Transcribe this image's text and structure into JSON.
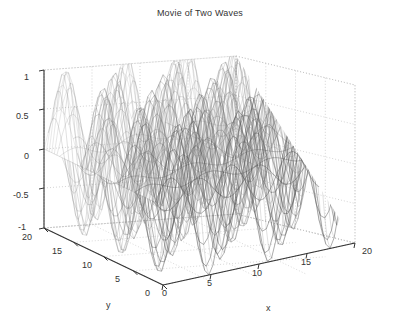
{
  "figure": {
    "title": "Movie of Two Waves",
    "background": "#ffffff",
    "axis_color": "#333333",
    "grid_style": "dotted",
    "surface_style": "mesh",
    "surface_colormap": "gray"
  },
  "axes": {
    "x": {
      "label": "x",
      "ticks": [
        "0",
        "5",
        "10",
        "15",
        "20"
      ],
      "min": 0,
      "max": 20
    },
    "y": {
      "label": "y",
      "ticks": [
        "20",
        "15",
        "10",
        "5",
        "0"
      ],
      "min": 0,
      "max": 20
    },
    "z": {
      "label": "",
      "ticks": [
        "1",
        "0.5",
        "0",
        "-0.5",
        "-1"
      ],
      "min": -1,
      "max": 1
    }
  },
  "chart_data": {
    "type": "surface",
    "title": "Movie of Two Waves",
    "xlabel": "x",
    "ylabel": "y",
    "zlabel": "",
    "xlim": [
      0,
      20
    ],
    "ylim": [
      0,
      20
    ],
    "zlim": [
      -1,
      1
    ],
    "xticks": [
      0,
      5,
      10,
      15,
      20
    ],
    "yticks": [
      0,
      5,
      10,
      15,
      20
    ],
    "zticks": [
      -1,
      -0.5,
      0,
      0.5,
      1
    ],
    "grid": true,
    "legend": null,
    "colormap": "gray",
    "shading": "mesh-lines",
    "formula": "z = sin(x) * cos(y) style two-wave superposition",
    "peaks_along_x": 3,
    "peaks_along_y": 3,
    "amplitude": 1,
    "wavelength_x": 6.3,
    "wavelength_y": 6.3
  }
}
